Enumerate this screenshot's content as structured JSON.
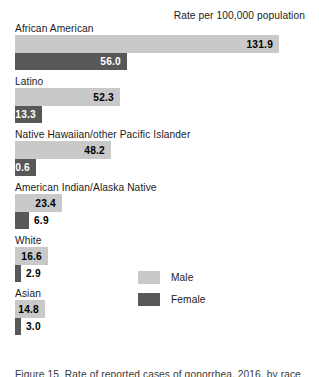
{
  "header": {
    "title": "Rate per 100,000 population"
  },
  "legend": {
    "items": [
      {
        "label": "Male",
        "color": "#c9c9c9",
        "swatch_name": "legend-swatch-male"
      },
      {
        "label": "Female",
        "color": "#585858",
        "swatch_name": "legend-swatch-female"
      }
    ]
  },
  "caption": {
    "text": "Figure 15. Rate of reported cases of gonorrhea, 2016, by race"
  },
  "colors": {
    "male_bar": "#c9c9c9",
    "female_bar": "#585858",
    "text": "#1b1b1b",
    "background": "#ffffff"
  },
  "chart_data": {
    "type": "bar",
    "orientation": "horizontal",
    "title": "Rate per 100,000 population",
    "xlabel": "Rate per 100,000 population",
    "ylabel": "",
    "xlim": [
      0,
      145
    ],
    "grid": false,
    "legend_position": "center-right",
    "categories": [
      "African American",
      "Latino",
      "Native Hawaiian/other Pacific Islander",
      "American Indian/Alaska Native",
      "White",
      "Asian"
    ],
    "series": [
      {
        "name": "Male",
        "color": "#c9c9c9",
        "values": [
          131.9,
          52.3,
          48.2,
          23.4,
          16.6,
          14.8
        ],
        "labels": [
          "131.9",
          "52.3",
          "48.2",
          "23.4",
          "16.6",
          "14.8"
        ]
      },
      {
        "name": "Female",
        "color": "#585858",
        "values": [
          56.0,
          13.3,
          10.6,
          6.9,
          2.9,
          3.0
        ],
        "labels": [
          "56.0",
          "13.3",
          "10.6",
          "6.9",
          "2.9",
          "3.0"
        ]
      }
    ],
    "groups": [
      {
        "label": "African American",
        "male": {
          "value": 131.9,
          "label": "131.9",
          "label_placement": "inside"
        },
        "female": {
          "value": 56.0,
          "label": "56.0",
          "label_placement": "inside"
        }
      },
      {
        "label": "Latino",
        "male": {
          "value": 52.3,
          "label": "52.3",
          "label_placement": "inside"
        },
        "female": {
          "value": 13.3,
          "label": "13.3",
          "label_placement": "inside"
        }
      },
      {
        "label": "Native Hawaiian/other Pacific Islander",
        "male": {
          "value": 48.2,
          "label": "48.2",
          "label_placement": "inside"
        },
        "female": {
          "value": 10.6,
          "label": "10.6",
          "label_placement": "inside"
        }
      },
      {
        "label": "American Indian/Alaska Native",
        "male": {
          "value": 23.4,
          "label": "23.4",
          "label_placement": "inside"
        },
        "female": {
          "value": 6.9,
          "label": "6.9",
          "label_placement": "outside"
        }
      },
      {
        "label": "White",
        "male": {
          "value": 16.6,
          "label": "16.6",
          "label_placement": "inside"
        },
        "female": {
          "value": 2.9,
          "label": "2.9",
          "label_placement": "outside"
        }
      },
      {
        "label": "Asian",
        "male": {
          "value": 14.8,
          "label": "14.8",
          "label_placement": "inside"
        },
        "female": {
          "value": 3.0,
          "label": "3.0",
          "label_placement": "outside"
        }
      }
    ]
  }
}
